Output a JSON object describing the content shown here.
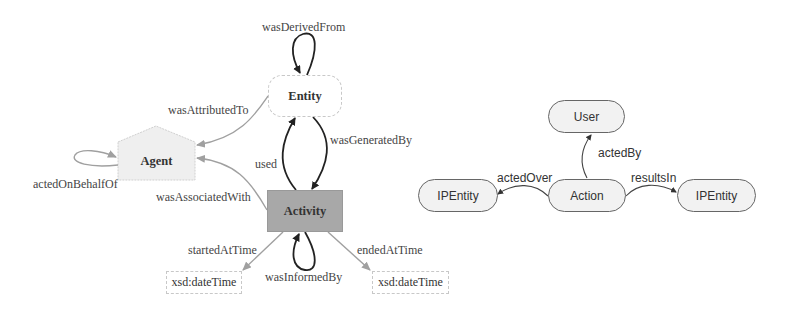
{
  "prov_diagram": {
    "nodes": {
      "entity": "Entity",
      "agent": "Agent",
      "activity": "Activity",
      "datetime_start": "xsd:dateTime",
      "datetime_end": "xsd:dateTime"
    },
    "edges": {
      "was_derived_from": "wasDerivedFrom",
      "was_attributed_to": "wasAttributedTo",
      "acted_on_behalf_of": "actedOnBehalfOf",
      "was_generated_by": "wasGeneratedBy",
      "used": "used",
      "was_associated_with": "wasAssociatedWith",
      "started_at_time": "startedAtTime",
      "ended_at_time": "endedAtTime",
      "was_informed_by": "wasInformedBy"
    }
  },
  "ip_diagram": {
    "nodes": {
      "user": "User",
      "action": "Action",
      "ip_entity_left": "IPEntity",
      "ip_entity_right": "IPEntity"
    },
    "edges": {
      "acted_by": "actedBy",
      "acted_over": "actedOver",
      "results_in": "resultsIn"
    }
  },
  "colors": {
    "black_edge": "#222222",
    "gray_edge": "#a0a0a0",
    "activity_fill": "#a8a8a8",
    "agent_fill": "#efefef"
  }
}
